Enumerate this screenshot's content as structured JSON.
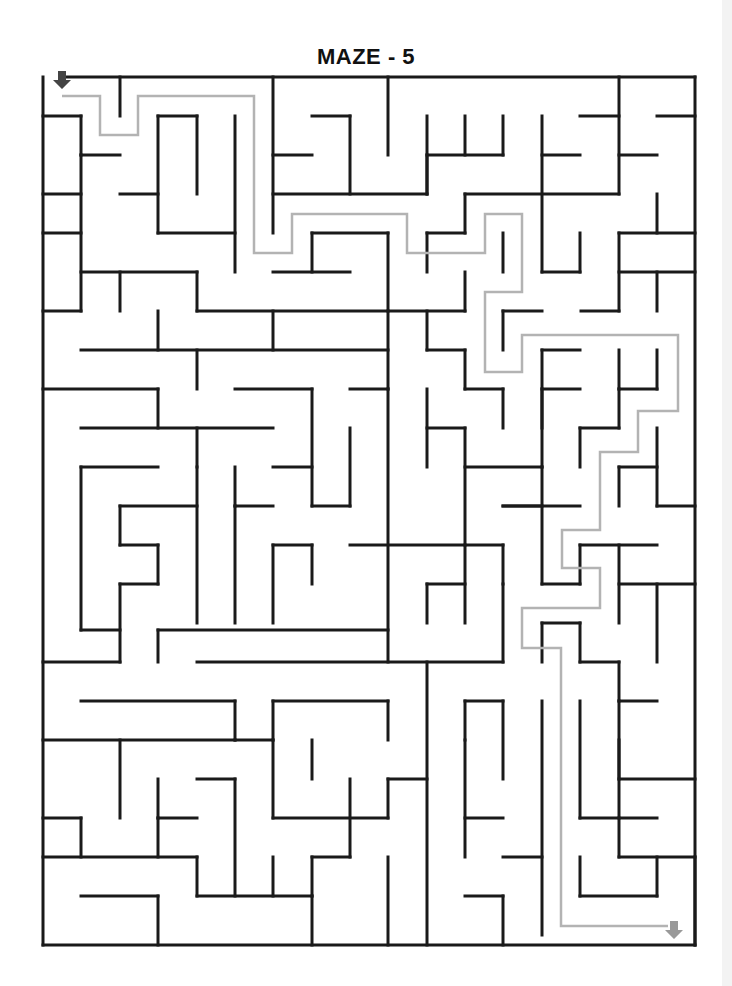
{
  "title": "MAZE - 5",
  "colors": {
    "wall": "#1a1a1a",
    "solution_path": "#b3b3b3",
    "start_arrow": "#444444",
    "end_arrow": "#999999",
    "background": "#ffffff"
  },
  "icons": {
    "start": "down-arrow-icon",
    "end": "down-arrow-icon"
  },
  "maze": {
    "walls": [
      [
        62,
        77,
        695,
        77
      ],
      [
        43,
        77,
        43,
        945
      ],
      [
        695,
        77,
        695,
        945
      ],
      [
        43,
        945,
        695,
        945
      ],
      [
        120,
        77,
        120,
        116
      ],
      [
        273,
        77,
        273,
        233
      ],
      [
        619,
        77,
        619,
        194
      ],
      [
        43,
        116,
        81,
        116
      ],
      [
        81,
        116,
        81,
        155
      ],
      [
        158,
        116,
        197,
        116
      ],
      [
        158,
        116,
        158,
        233
      ],
      [
        197,
        116,
        197,
        194
      ],
      [
        235,
        116,
        235,
        272
      ],
      [
        312,
        116,
        350,
        116
      ],
      [
        350,
        116,
        350,
        194
      ],
      [
        388,
        77,
        388,
        155
      ],
      [
        427,
        116,
        427,
        194
      ],
      [
        465,
        116,
        465,
        155
      ],
      [
        503,
        116,
        503,
        155
      ],
      [
        427,
        155,
        503,
        155
      ],
      [
        542,
        116,
        542,
        272
      ],
      [
        580,
        116,
        619,
        116
      ],
      [
        657,
        116,
        695,
        116
      ],
      [
        81,
        155,
        81,
        311
      ],
      [
        81,
        155,
        120,
        155
      ],
      [
        273,
        155,
        312,
        155
      ],
      [
        542,
        155,
        580,
        155
      ],
      [
        619,
        155,
        657,
        155
      ],
      [
        43,
        194,
        81,
        194
      ],
      [
        120,
        194,
        158,
        194
      ],
      [
        273,
        194,
        427,
        194
      ],
      [
        427,
        194,
        427,
        155
      ],
      [
        465,
        194,
        619,
        194
      ],
      [
        465,
        194,
        465,
        233
      ],
      [
        657,
        194,
        657,
        233
      ],
      [
        619,
        233,
        695,
        233
      ],
      [
        619,
        233,
        619,
        311
      ],
      [
        43,
        233,
        81,
        233
      ],
      [
        158,
        233,
        235,
        233
      ],
      [
        312,
        233,
        388,
        233
      ],
      [
        312,
        233,
        312,
        272
      ],
      [
        388,
        233,
        388,
        389
      ],
      [
        427,
        233,
        465,
        233
      ],
      [
        427,
        233,
        427,
        272
      ],
      [
        580,
        233,
        580,
        272
      ],
      [
        542,
        272,
        580,
        272
      ],
      [
        81,
        272,
        197,
        272
      ],
      [
        197,
        272,
        197,
        311
      ],
      [
        273,
        272,
        350,
        272
      ],
      [
        503,
        233,
        503,
        272
      ],
      [
        465,
        272,
        465,
        311
      ],
      [
        388,
        311,
        465,
        311
      ],
      [
        619,
        272,
        695,
        272
      ],
      [
        657,
        272,
        657,
        311
      ],
      [
        43,
        311,
        81,
        311
      ],
      [
        120,
        272,
        120,
        311
      ],
      [
        197,
        311,
        388,
        311
      ],
      [
        581,
        311,
        619,
        311
      ],
      [
        503,
        311,
        503,
        350
      ],
      [
        503,
        311,
        542,
        311
      ],
      [
        81,
        350,
        388,
        350
      ],
      [
        158,
        311,
        158,
        350
      ],
      [
        273,
        311,
        273,
        350
      ],
      [
        197,
        350,
        197,
        389
      ],
      [
        427,
        311,
        427,
        350
      ],
      [
        427,
        350,
        465,
        350
      ],
      [
        465,
        350,
        465,
        389
      ],
      [
        465,
        389,
        503,
        389
      ],
      [
        503,
        389,
        503,
        428
      ],
      [
        542,
        350,
        542,
        428
      ],
      [
        542,
        350,
        580,
        350
      ],
      [
        542,
        389,
        580,
        389
      ],
      [
        619,
        350,
        619,
        389
      ],
      [
        657,
        350,
        657,
        389
      ],
      [
        619,
        389,
        657,
        389
      ],
      [
        43,
        389,
        158,
        389
      ],
      [
        158,
        389,
        158,
        428
      ],
      [
        235,
        389,
        312,
        389
      ],
      [
        350,
        389,
        388,
        389
      ],
      [
        81,
        428,
        273,
        428
      ],
      [
        197,
        428,
        197,
        467
      ],
      [
        312,
        389,
        312,
        506
      ],
      [
        350,
        428,
        350,
        506
      ],
      [
        427,
        389,
        427,
        467
      ],
      [
        427,
        428,
        465,
        428
      ],
      [
        465,
        428,
        465,
        545
      ],
      [
        580,
        428,
        619,
        428
      ],
      [
        580,
        428,
        580,
        467
      ],
      [
        542,
        389,
        542,
        467
      ],
      [
        465,
        467,
        542,
        467
      ],
      [
        619,
        389,
        619,
        428
      ],
      [
        657,
        428,
        657,
        506
      ],
      [
        619,
        467,
        657,
        467
      ],
      [
        619,
        467,
        619,
        506
      ],
      [
        81,
        467,
        158,
        467
      ],
      [
        81,
        467,
        81,
        630
      ],
      [
        235,
        467,
        235,
        506
      ],
      [
        273,
        467,
        312,
        467
      ],
      [
        235,
        506,
        273,
        506
      ],
      [
        388,
        389,
        388,
        662
      ],
      [
        120,
        506,
        197,
        506
      ],
      [
        120,
        506,
        120,
        545
      ],
      [
        120,
        545,
        158,
        545
      ],
      [
        158,
        545,
        158,
        584
      ],
      [
        120,
        584,
        158,
        584
      ],
      [
        120,
        584,
        120,
        662
      ],
      [
        197,
        467,
        197,
        623
      ],
      [
        235,
        506,
        235,
        623
      ],
      [
        273,
        545,
        312,
        545
      ],
      [
        273,
        545,
        273,
        623
      ],
      [
        312,
        545,
        312,
        584
      ],
      [
        350,
        545,
        503,
        545
      ],
      [
        312,
        506,
        350,
        506
      ],
      [
        503,
        506,
        542,
        506
      ],
      [
        542,
        467,
        542,
        584
      ],
      [
        503,
        506,
        580,
        506
      ],
      [
        580,
        545,
        657,
        545
      ],
      [
        619,
        545,
        619,
        623
      ],
      [
        657,
        506,
        695,
        506
      ],
      [
        427,
        584,
        465,
        584
      ],
      [
        427,
        584,
        427,
        623
      ],
      [
        465,
        545,
        465,
        623
      ],
      [
        503,
        545,
        503,
        584
      ],
      [
        542,
        584,
        580,
        584
      ],
      [
        580,
        584,
        580,
        545
      ],
      [
        619,
        584,
        695,
        584
      ],
      [
        657,
        584,
        657,
        662
      ],
      [
        81,
        630,
        120,
        630
      ],
      [
        158,
        630,
        388,
        630
      ],
      [
        158,
        630,
        158,
        662
      ],
      [
        43,
        662,
        120,
        662
      ],
      [
        197,
        662,
        503,
        662
      ],
      [
        503,
        584,
        503,
        662
      ],
      [
        542,
        623,
        542,
        662
      ],
      [
        542,
        623,
        580,
        623
      ],
      [
        580,
        623,
        580,
        662
      ],
      [
        580,
        662,
        619,
        662
      ],
      [
        619,
        662,
        619,
        701
      ],
      [
        619,
        701,
        657,
        701
      ],
      [
        81,
        701,
        235,
        701
      ],
      [
        235,
        701,
        235,
        740
      ],
      [
        235,
        740,
        273,
        740
      ],
      [
        273,
        701,
        273,
        740
      ],
      [
        273,
        701,
        388,
        701
      ],
      [
        388,
        701,
        388,
        740
      ],
      [
        312,
        740,
        312,
        779
      ],
      [
        427,
        662,
        427,
        945
      ],
      [
        465,
        701,
        503,
        701
      ],
      [
        465,
        701,
        465,
        740
      ],
      [
        503,
        701,
        503,
        779
      ],
      [
        580,
        701,
        580,
        818
      ],
      [
        619,
        740,
        619,
        779
      ],
      [
        619,
        701,
        619,
        818
      ],
      [
        619,
        779,
        695,
        779
      ],
      [
        43,
        740,
        235,
        740
      ],
      [
        120,
        740,
        120,
        818
      ],
      [
        158,
        779,
        158,
        818
      ],
      [
        197,
        779,
        235,
        779
      ],
      [
        273,
        740,
        273,
        818
      ],
      [
        273,
        818,
        388,
        818
      ],
      [
        388,
        779,
        427,
        779
      ],
      [
        388,
        779,
        388,
        818
      ],
      [
        235,
        779,
        235,
        896
      ],
      [
        350,
        779,
        350,
        857
      ],
      [
        312,
        857,
        350,
        857
      ],
      [
        43,
        818,
        81,
        818
      ],
      [
        81,
        818,
        81,
        857
      ],
      [
        158,
        818,
        197,
        818
      ],
      [
        158,
        818,
        158,
        857
      ],
      [
        465,
        740,
        465,
        857
      ],
      [
        465,
        818,
        503,
        818
      ],
      [
        542,
        701,
        542,
        935
      ],
      [
        580,
        818,
        657,
        818
      ],
      [
        619,
        818,
        619,
        857
      ],
      [
        619,
        857,
        695,
        857
      ],
      [
        43,
        857,
        197,
        857
      ],
      [
        197,
        857,
        197,
        896
      ],
      [
        197,
        896,
        312,
        896
      ],
      [
        312,
        857,
        312,
        896
      ],
      [
        503,
        857,
        542,
        857
      ],
      [
        580,
        857,
        580,
        896
      ],
      [
        580,
        896,
        657,
        896
      ],
      [
        657,
        857,
        657,
        896
      ],
      [
        273,
        857,
        273,
        896
      ],
      [
        388,
        857,
        388,
        945
      ],
      [
        81,
        896,
        158,
        896
      ],
      [
        158,
        896,
        158,
        945
      ],
      [
        312,
        896,
        312,
        945
      ],
      [
        465,
        896,
        503,
        896
      ],
      [
        503,
        896,
        503,
        945
      ],
      [
        695,
        857,
        695,
        945
      ]
    ],
    "solution_path": [
      [
        62,
        96
      ],
      [
        100,
        96
      ],
      [
        100,
        135
      ],
      [
        138,
        135
      ],
      [
        138,
        96
      ],
      [
        254,
        96
      ],
      [
        254,
        253
      ],
      [
        292,
        253
      ],
      [
        292,
        214
      ],
      [
        407,
        214
      ],
      [
        407,
        253
      ],
      [
        485,
        253
      ],
      [
        485,
        214
      ],
      [
        522,
        214
      ],
      [
        522,
        292
      ],
      [
        485,
        292
      ],
      [
        485,
        372
      ],
      [
        522,
        372
      ],
      [
        522,
        335
      ],
      [
        678,
        335
      ],
      [
        678,
        411
      ],
      [
        638,
        411
      ],
      [
        638,
        452
      ],
      [
        600,
        452
      ],
      [
        600,
        530
      ],
      [
        562,
        530
      ],
      [
        562,
        568
      ],
      [
        600,
        568
      ],
      [
        600,
        608
      ],
      [
        522,
        608
      ],
      [
        522,
        648
      ],
      [
        561,
        648
      ],
      [
        561,
        926
      ],
      [
        668,
        926
      ]
    ],
    "start_arrow": {
      "x": 62,
      "y": 80
    },
    "end_arrow": {
      "x": 674,
      "y": 930
    }
  }
}
